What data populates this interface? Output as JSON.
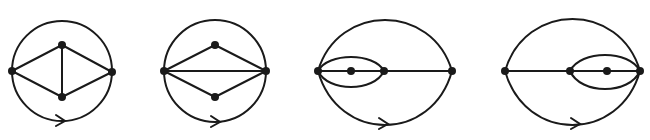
{
  "figure": {
    "stroke_color": "#1a1a1a",
    "background": "#ffffff",
    "diagrams": [
      {
        "id": "diagram-1",
        "outer": {
          "type": "circle",
          "cx": 62,
          "cy": 71,
          "r": 50
        },
        "vertices": [
          [
            12,
            71
          ],
          [
            112,
            72
          ],
          [
            62,
            45
          ],
          [
            62,
            97
          ]
        ],
        "edges": [
          {
            "type": "line",
            "from": [
              12,
              71
            ],
            "to": [
              62,
              45
            ]
          },
          {
            "type": "line",
            "from": [
              62,
              45
            ],
            "to": [
              112,
              72
            ]
          },
          {
            "type": "line",
            "from": [
              12,
              71
            ],
            "to": [
              62,
              97
            ]
          },
          {
            "type": "line",
            "from": [
              62,
              97
            ],
            "to": [
              112,
              72
            ]
          },
          {
            "type": "line",
            "from": [
              62,
              45
            ],
            "to": [
              62,
              97
            ]
          }
        ],
        "arrow": {
          "x": 62,
          "y": 121,
          "direction": "right"
        }
      },
      {
        "id": "diagram-2",
        "outer": {
          "type": "circle",
          "cx": 215,
          "cy": 71,
          "r": 51
        },
        "vertices": [
          [
            164,
            71
          ],
          [
            266,
            71
          ],
          [
            215,
            45
          ],
          [
            215,
            97
          ]
        ],
        "edges": [
          {
            "type": "line",
            "from": [
              164,
              71
            ],
            "to": [
              215,
              45
            ]
          },
          {
            "type": "line",
            "from": [
              215,
              45
            ],
            "to": [
              266,
              71
            ]
          },
          {
            "type": "line",
            "from": [
              164,
              71
            ],
            "to": [
              215,
              97
            ]
          },
          {
            "type": "line",
            "from": [
              215,
              97
            ],
            "to": [
              266,
              71
            ]
          },
          {
            "type": "line",
            "from": [
              164,
              71
            ],
            "to": [
              266,
              71
            ]
          }
        ],
        "arrow": {
          "x": 217,
          "y": 122,
          "direction": "right"
        }
      },
      {
        "id": "diagram-3",
        "outer": {
          "type": "lens",
          "left": [
            318,
            71
          ],
          "right": [
            452,
            71
          ],
          "top_y": 20,
          "bottom_y": 125
        },
        "vertices": [
          [
            318,
            71
          ],
          [
            351,
            71
          ],
          [
            384,
            71
          ],
          [
            452,
            71
          ]
        ],
        "edges": [
          {
            "type": "line",
            "from": [
              318,
              71
            ],
            "to": [
              452,
              71
            ]
          },
          {
            "type": "lens",
            "left": [
              318,
              71
            ],
            "right": [
              384,
              71
            ],
            "top_y": 57,
            "bottom_y": 87
          }
        ],
        "arrow": {
          "x": 385,
          "y": 124,
          "direction": "right"
        }
      },
      {
        "id": "diagram-4",
        "outer": {
          "type": "lens",
          "left": [
            505,
            71
          ],
          "right": [
            640,
            71
          ],
          "top_y": 19,
          "bottom_y": 125
        },
        "vertices": [
          [
            505,
            71
          ],
          [
            570,
            71
          ],
          [
            607,
            71
          ],
          [
            640,
            71
          ]
        ],
        "edges": [
          {
            "type": "line",
            "from": [
              505,
              71
            ],
            "to": [
              640,
              71
            ]
          },
          {
            "type": "lens",
            "left": [
              570,
              71
            ],
            "right": [
              640,
              71
            ],
            "top_y": 55,
            "bottom_y": 89
          }
        ],
        "arrow": {
          "x": 577,
          "y": 124,
          "direction": "right"
        }
      }
    ]
  }
}
